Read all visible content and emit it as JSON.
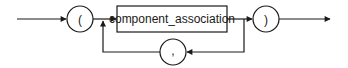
{
  "diagram": {
    "type": "syntax-railroad",
    "nodes": {
      "open_paren": {
        "label": "(",
        "shape": "circle"
      },
      "component_association": {
        "label": "component_association",
        "shape": "rectangle"
      },
      "comma": {
        "label": ",",
        "shape": "circle"
      },
      "close_paren": {
        "label": ")",
        "shape": "circle"
      }
    },
    "edges": [
      {
        "from": "entry",
        "to": "open_paren"
      },
      {
        "from": "open_paren",
        "to": "component_association"
      },
      {
        "from": "component_association",
        "to": "close_paren"
      },
      {
        "from": "component_association",
        "to": "comma",
        "kind": "loop-back"
      },
      {
        "from": "comma",
        "to": "component_association",
        "kind": "loop-back"
      },
      {
        "from": "close_paren",
        "to": "exit"
      }
    ],
    "colors": {
      "stroke": "#1a1a1a",
      "background": "#ffffff"
    }
  }
}
